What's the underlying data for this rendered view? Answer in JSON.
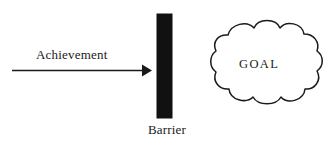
{
  "figure": {
    "type": "concept-diagram",
    "background_color": "#ffffff",
    "stroke_color": "#1a1a1a",
    "barrier_fill": "#111111",
    "width": 336,
    "height": 148
  },
  "arrow": {
    "label": "Achievement",
    "direction": "right",
    "from_x": 12,
    "to_x": 150,
    "y": 70
  },
  "barrier": {
    "label": "Barrier",
    "x": 157,
    "y": 14,
    "width": 15,
    "height": 104
  },
  "goal": {
    "label": "GOAL",
    "shape": "cloud",
    "center_x": 266,
    "center_y": 69
  }
}
